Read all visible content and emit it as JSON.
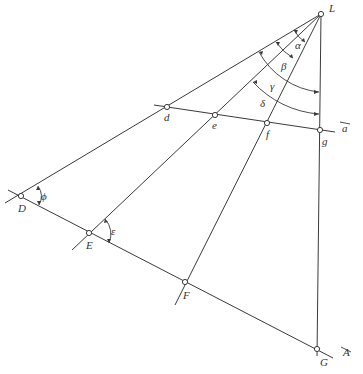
{
  "diagram": {
    "points": {
      "L": "L",
      "d": "d",
      "e": "e",
      "f": "f",
      "g": "g",
      "D": "D",
      "E": "E",
      "F": "F",
      "G": "G"
    },
    "angles": {
      "alpha": "α",
      "beta": "β",
      "gamma": "γ",
      "delta": "δ",
      "epsilon": "ε",
      "phi": "ϕ"
    },
    "lines": {
      "a": "a",
      "A": "A"
    }
  }
}
